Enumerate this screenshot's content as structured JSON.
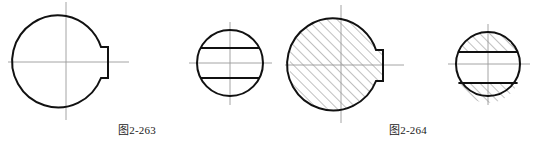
{
  "page": {
    "background_color": "#ffffff",
    "width": 546,
    "height": 145,
    "kind": "engineering-drawing"
  },
  "style": {
    "outline_color": "#111111",
    "outline_width": 2.0,
    "hatch_color": "#4a4a4a",
    "hatch_width": 0.6,
    "centerline_color": "#9a9a9a",
    "centerline_width": 0.9,
    "chord_color": "#111111",
    "chord_width": 2.0
  },
  "captions": [
    {
      "id": "fig-2-263",
      "text": "图2-263",
      "x": 118,
      "y": 124
    },
    {
      "id": "fig-2-264",
      "text": "图2-264",
      "x": 389,
      "y": 124
    }
  ],
  "figures": [
    {
      "id": "figure-1",
      "name": "notched-disc-outline",
      "group": "图2-263",
      "type": "circle-with-keyway-notch",
      "hatched": false,
      "center": {
        "x": 66,
        "y": 62
      },
      "radius": 46,
      "notch": {
        "back_x": 101,
        "mouth_x": 108,
        "top_y": 47,
        "bottom_y": 78
      },
      "centerlines": {
        "horizontal": {
          "x1": 8,
          "x2": 129,
          "y": 62
        },
        "vertical": {
          "y1": 2,
          "y2": 120,
          "x": 66
        }
      }
    },
    {
      "id": "figure-2",
      "name": "disc-with-two-chords-outline",
      "group": "图2-263",
      "type": "circle-with-parallel-chords",
      "hatched": false,
      "center": {
        "x": 230,
        "y": 63
      },
      "radius": 33,
      "chords": [
        {
          "id": "upper-chord",
          "y": 48
        },
        {
          "id": "lower-chord",
          "y": 78
        }
      ],
      "centerlines": {
        "horizontal": {
          "x1": 189,
          "x2": 272,
          "y": 63
        },
        "vertical": {
          "y1": 22,
          "y2": 105,
          "x": 230
        }
      }
    },
    {
      "id": "figure-3",
      "name": "notched-disc-sectioned",
      "group": "图2-264",
      "type": "circle-with-keyway-notch",
      "hatched": true,
      "hatch_angle_deg": 45,
      "hatch_spacing": 7,
      "center": {
        "x": 341,
        "y": 65
      },
      "radius": 46,
      "notch": {
        "back_x": 376,
        "mouth_x": 383,
        "top_y": 50,
        "bottom_y": 81
      },
      "centerlines": {
        "horizontal": {
          "x1": 285,
          "x2": 404,
          "y": 65
        },
        "vertical": {
          "y1": 5,
          "y2": 123,
          "x": 341
        }
      }
    },
    {
      "id": "figure-4",
      "name": "disc-with-two-chords-sectioned",
      "group": "图2-264",
      "type": "circle-with-parallel-chords",
      "hatched": true,
      "hatch_angle_deg": 45,
      "hatch_spacing": 7,
      "hatched_regions": [
        "above-upper-chord",
        "below-lower-chord"
      ],
      "center": {
        "x": 488,
        "y": 64
      },
      "radius": 32,
      "chords": [
        {
          "id": "upper-chord",
          "y": 52
        },
        {
          "id": "lower-chord",
          "y": 83
        }
      ],
      "centerlines": {
        "horizontal": {
          "x1": 448,
          "x2": 530,
          "y": 64
        },
        "vertical": {
          "y1": 24,
          "y2": 105,
          "x": 488
        }
      }
    }
  ]
}
